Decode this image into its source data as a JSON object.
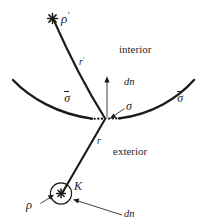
{
  "figure": {
    "background_color": "#ffffff",
    "ink_color": "#1a1a1a",
    "width": 205,
    "height": 223
  },
  "regions": {
    "interior_label": "interior",
    "exterior_label": "exterior"
  },
  "surface": {
    "left_patch_label": "σ",
    "right_patch_label": "σ",
    "element_label": "σ",
    "normal_label": "dn"
  },
  "sources": {
    "image_source_label": "ρ",
    "image_source_prime": "′",
    "image_distance_label": "r",
    "image_distance_prime": "′",
    "real_source_label": "ρ",
    "real_distance_label": "r",
    "enclosing_curve_label": "K",
    "source_normal_label": "dn"
  }
}
